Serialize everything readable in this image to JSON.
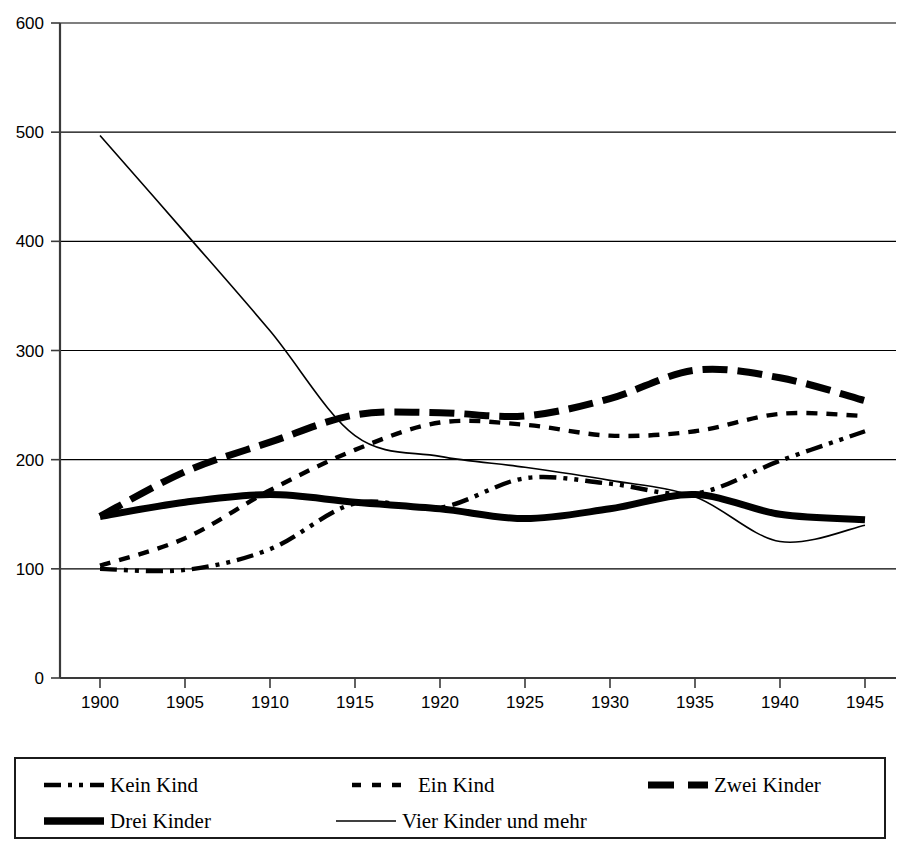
{
  "chart_data": {
    "type": "line",
    "title": "",
    "xlabel": "",
    "ylabel": "",
    "xlim": [
      1900,
      1945
    ],
    "ylim": [
      0,
      600
    ],
    "grid": true,
    "x_ticks": [
      1900,
      1905,
      1910,
      1915,
      1920,
      1925,
      1930,
      1935,
      1940,
      1945
    ],
    "y_ticks": [
      0,
      100,
      200,
      300,
      400,
      500,
      600
    ],
    "legend_position": "bottom",
    "x": [
      1900,
      1905,
      1910,
      1915,
      1920,
      1925,
      1930,
      1935,
      1940,
      1945
    ],
    "series": [
      {
        "name": "Kein Kind",
        "style": "dash-dot-dot",
        "width": "medium",
        "values": [
          100,
          99,
          118,
          160,
          156,
          183,
          178,
          169,
          199,
          226
        ]
      },
      {
        "name": "Ein Kind",
        "style": "dashed",
        "width": "medium",
        "values": [
          103,
          128,
          172,
          209,
          234,
          232,
          222,
          226,
          242,
          240
        ]
      },
      {
        "name": "Zwei Kinder",
        "style": "thick-dashed",
        "width": "thick",
        "values": [
          148,
          189,
          216,
          241,
          243,
          240,
          256,
          282,
          275,
          254
        ]
      },
      {
        "name": "Drei Kinder",
        "style": "solid",
        "width": "thick",
        "values": [
          148,
          161,
          168,
          161,
          155,
          146,
          155,
          168,
          150,
          145
        ]
      },
      {
        "name": "Vier Kinder und mehr",
        "style": "thin-solid",
        "width": "thin",
        "values": [
          497,
          408,
          318,
          222,
          203,
          193,
          181,
          166,
          125,
          140
        ]
      }
    ]
  },
  "axes": {
    "y_tick_labels": [
      "600",
      "500",
      "400",
      "300",
      "200",
      "100",
      "0"
    ],
    "x_tick_labels": [
      "1900",
      "1905",
      "1910",
      "1915",
      "1920",
      "1925",
      "1930",
      "1935",
      "1940",
      "1945"
    ]
  },
  "legend": {
    "items": [
      {
        "label": "Kein Kind",
        "style": "dash-dot-dot"
      },
      {
        "label": "Ein Kind",
        "style": "dashed"
      },
      {
        "label": "Zwei Kinder",
        "style": "thick-dashed"
      },
      {
        "label": "Drei Kinder",
        "style": "solid"
      },
      {
        "label": "Vier Kinder und mehr",
        "style": "thin-solid"
      }
    ]
  }
}
